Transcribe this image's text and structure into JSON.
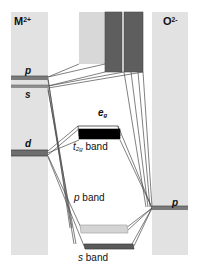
{
  "figure": {
    "type": "energy-level-correlation-diagram"
  },
  "columns": {
    "left": {
      "label": "M",
      "charge": "2+",
      "name": "metal-cation-column",
      "x": 11,
      "y": 12,
      "width": 37,
      "height": 243,
      "fill": "#e2e2e2"
    },
    "right": {
      "label": "O",
      "charge": "2-",
      "name": "oxide-anion-column",
      "x": 152,
      "y": 12,
      "width": 36,
      "height": 243,
      "fill": "#e2e2e2"
    }
  },
  "left_levels": [
    {
      "label": "p",
      "name": "metal-p-level",
      "x": 11,
      "y": 76,
      "width": 37,
      "height": 4,
      "fill": "#7a7a7a"
    },
    {
      "label": "s",
      "name": "metal-s-level",
      "x": 11,
      "y": 85,
      "width": 37,
      "height": 3,
      "fill": "#8f8f8f"
    },
    {
      "label": "d",
      "name": "metal-d-level",
      "x": 11,
      "y": 150,
      "width": 37,
      "height": 6,
      "fill": "#6e6e6e"
    }
  ],
  "right_levels": [
    {
      "label": "p",
      "name": "oxygen-p-level",
      "x": 152,
      "y": 206,
      "width": 36,
      "height": 4,
      "fill": "#7a7a7a"
    }
  ],
  "bands": [
    {
      "label": "e",
      "sub": "g",
      "name": "eg-band",
      "fill": "#ffffff",
      "stroke": "#3a3a3a"
    },
    {
      "label": "t",
      "sub": "2g",
      "suffix": " band",
      "name": "t2g-band",
      "fill": "#000000",
      "stroke": "#000000"
    },
    {
      "label": "p",
      "suffix": " band",
      "name": "p-band",
      "fill": "#d4d4d4",
      "stroke": "#8a8a8a"
    },
    {
      "label": "s",
      "suffix": " band",
      "name": "s-band",
      "fill": "#5a5a5a",
      "stroke": "#3a3a3a"
    }
  ],
  "top_blocks": [
    {
      "name": "conduction-band-light-block",
      "x": 79,
      "y": 12,
      "width": 26,
      "height": 52,
      "fill": "#d8d8d8"
    },
    {
      "name": "conduction-band-dark-block-a",
      "x": 105,
      "y": 12,
      "width": 17,
      "height": 60,
      "fill": "#5e5e5e"
    },
    {
      "name": "conduction-band-dark-block-b",
      "x": 124,
      "y": 12,
      "width": 19,
      "height": 60,
      "fill": "#5e5e5e"
    }
  ],
  "labels": {
    "metal_cation": "M",
    "metal_charge": "2+",
    "oxide_anion": "O",
    "oxide_charge": "2-",
    "left_p": "p",
    "left_s": "s",
    "left_d": "d",
    "right_p": "p",
    "eg_main": "e",
    "eg_sub": "g",
    "t2g_main": "t",
    "t2g_sub": "2g",
    "t2g_suffix": " band",
    "p_band_main": "p",
    "p_band_suffix": " band",
    "s_band_main": "s",
    "s_band_suffix": " band"
  },
  "colors": {
    "column_fill": "#e2e2e2",
    "dark_block": "#5e5e5e",
    "light_block": "#d8d8d8",
    "t2g_fill": "#000000",
    "p_band_fill": "#d4d4d4",
    "s_band_fill": "#5a5a5a",
    "line_stroke": "#4a4a4a",
    "text": "#111111",
    "background": "#ffffff"
  }
}
